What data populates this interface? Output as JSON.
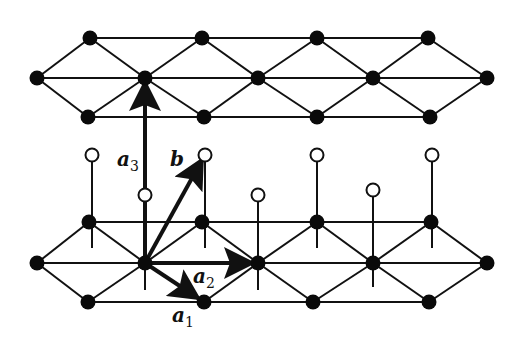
{
  "figure": {
    "colors": {
      "line": "#111111",
      "filled_atom": "#0a0a0a",
      "open_atom_fill": "#ffffff",
      "background": "#ffffff"
    }
  },
  "labels": {
    "a1": {
      "base": "a",
      "sub": "1",
      "x": 172,
      "y": 322
    },
    "a2": {
      "base": "a",
      "sub": "2",
      "x": 193,
      "y": 283
    },
    "a3": {
      "base": "a",
      "sub": "3",
      "x": 117,
      "y": 166
    },
    "b": {
      "base": "b",
      "sub": "",
      "x": 170,
      "y": 166
    }
  },
  "top_layer": {
    "row_top": {
      "y": 38,
      "xs": [
        90,
        202,
        317,
        428
      ]
    },
    "row_mid": {
      "y": 78,
      "xs": [
        37,
        145,
        258,
        373,
        487
      ]
    },
    "row_bottom": {
      "y": 117,
      "xs": [
        88,
        204,
        317,
        430
      ]
    }
  },
  "bottom_layer": {
    "row_top": {
      "y": 222,
      "xs": [
        89,
        202,
        317,
        431
      ]
    },
    "row_mid": {
      "y": 263,
      "xs": [
        37,
        145,
        258,
        373,
        487
      ]
    },
    "row_bottom": {
      "y": 302,
      "xs": [
        88,
        204,
        313,
        429
      ]
    }
  },
  "open_atoms": [
    {
      "x": 92,
      "y": 155,
      "stem_to": 248
    },
    {
      "x": 205,
      "y": 155,
      "stem_to": 248
    },
    {
      "x": 317,
      "y": 155,
      "stem_to": 248
    },
    {
      "x": 432,
      "y": 155,
      "stem_to": 248
    },
    {
      "x": 145,
      "y": 195,
      "stem_to": 290
    },
    {
      "x": 258,
      "y": 195,
      "stem_to": 290
    },
    {
      "x": 373,
      "y": 190,
      "stem_to": 287
    }
  ],
  "vectors": {
    "origin": {
      "x": 145,
      "y": 263
    },
    "a1": {
      "to_x": 198,
      "to_y": 298
    },
    "a2": {
      "to_x": 252,
      "to_y": 263
    },
    "a3": {
      "to_x": 145,
      "to_y": 83
    },
    "b": {
      "to_x": 202,
      "to_y": 160
    }
  }
}
